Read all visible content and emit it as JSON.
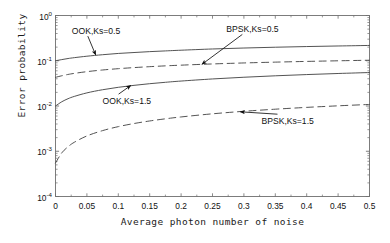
{
  "chart_data": {
    "type": "line",
    "title": "",
    "xlabel": "Average photon number of noise",
    "ylabel": "Error probability",
    "xlim": [
      0,
      0.5
    ],
    "ylim": [
      0.0001,
      1
    ],
    "yscale": "log",
    "xscale": "linear",
    "grid": false,
    "legend_position": "none",
    "xticks": [
      "0",
      "0.05",
      "0.1",
      "0.15",
      "0.2",
      "0.25",
      "0.3",
      "0.35",
      "0.4",
      "0.45",
      "0.5"
    ],
    "xtick_values": [
      0,
      0.05,
      0.1,
      0.15,
      0.2,
      0.25,
      0.3,
      0.35,
      0.4,
      0.45,
      0.5
    ],
    "yticks": [
      "10",
      "10",
      "10",
      "10",
      "10"
    ],
    "ytick_exponents": [
      "0",
      "-1",
      "-2",
      "-3",
      "-4"
    ],
    "ytick_values": [
      1,
      0.1,
      0.01,
      0.001,
      0.0001
    ],
    "x": [
      0,
      0.01,
      0.02,
      0.03,
      0.05,
      0.075,
      0.1,
      0.125,
      0.15,
      0.175,
      0.2,
      0.25,
      0.3,
      0.35,
      0.4,
      0.45,
      0.5
    ],
    "series": [
      {
        "name": "OOK,Ks=0.5",
        "style": "solid",
        "color": "#4a4a4a",
        "values": [
          0.1,
          0.106,
          0.112,
          0.117,
          0.126,
          0.136,
          0.145,
          0.152,
          0.159,
          0.165,
          0.171,
          0.182,
          0.191,
          0.199,
          0.206,
          0.212,
          0.218
        ]
      },
      {
        "name": "BPSK,Ks=0.5",
        "style": "dashed",
        "color": "#4a4a4a",
        "values": [
          0.043,
          0.0466,
          0.0498,
          0.0526,
          0.0574,
          0.0625,
          0.0668,
          0.0706,
          0.074,
          0.0771,
          0.0799,
          0.085,
          0.0894,
          0.0932,
          0.0967,
          0.0998,
          0.1027
        ]
      },
      {
        "name": "OOK,Ks=1.5",
        "style": "solid",
        "color": "#4a4a4a",
        "values": [
          0.01,
          0.0124,
          0.0145,
          0.0163,
          0.0195,
          0.0229,
          0.0259,
          0.0286,
          0.0311,
          0.0334,
          0.0356,
          0.0396,
          0.0432,
          0.0465,
          0.0495,
          0.0523,
          0.0549
        ]
      },
      {
        "name": "BPSK,Ks=1.5",
        "style": "dashed",
        "color": "#4a4a4a",
        "values": [
          0.00055,
          0.00092,
          0.00126,
          0.00158,
          0.00218,
          0.00286,
          0.0035,
          0.0041,
          0.00467,
          0.00521,
          0.00573,
          0.00672,
          0.00764,
          0.0085,
          0.00932,
          0.01009,
          0.01083
        ]
      }
    ],
    "annotations": [
      {
        "text": "OOK,Ks=0.5",
        "label_x": 0.026,
        "label_y": 0.44,
        "tip_x": 0.064,
        "tip_y": 0.134
      },
      {
        "text": "BPSK,Ks=0.5",
        "label_x": 0.272,
        "label_y": 0.48,
        "tip_x": 0.233,
        "tip_y": 0.083
      },
      {
        "text": "OOK,Ks=1.5",
        "label_x": 0.075,
        "label_y": 0.0125,
        "tip_x": 0.12,
        "tip_y": 0.0285
      },
      {
        "text": "BPSK,Ks=1.5",
        "label_x": 0.328,
        "label_y": 0.0045,
        "tip_x": 0.294,
        "tip_y": 0.00745
      }
    ]
  }
}
